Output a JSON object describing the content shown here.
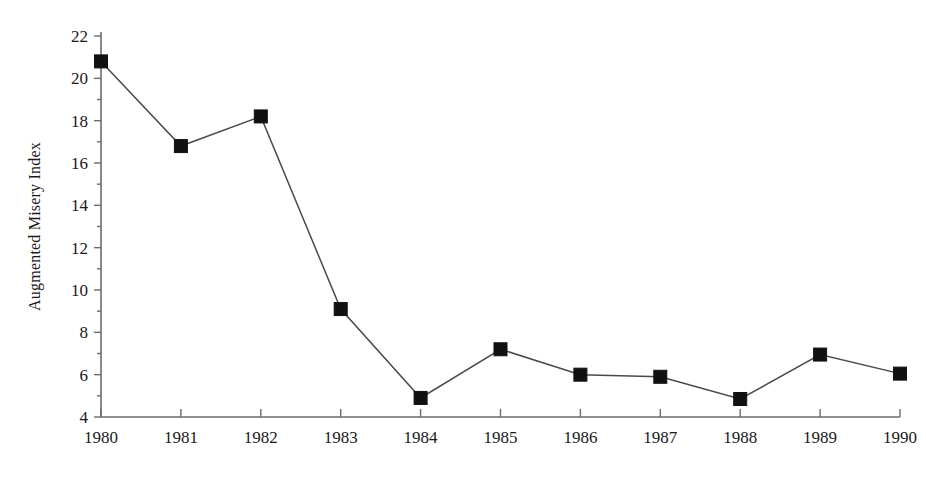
{
  "chart_data": {
    "type": "line",
    "title": "",
    "subtitle": "",
    "xlabel": "",
    "ylabel": "Augmented Misery Index",
    "categories": [
      "1980",
      "1981",
      "1982",
      "1983",
      "1984",
      "1985",
      "1986",
      "1987",
      "1988",
      "1989",
      "1990"
    ],
    "x": [
      1980,
      1981,
      1982,
      1983,
      1984,
      1985,
      1986,
      1987,
      1988,
      1989,
      1990
    ],
    "values": [
      20.8,
      16.8,
      18.2,
      9.1,
      4.9,
      7.2,
      6.0,
      5.9,
      4.85,
      6.95,
      6.05
    ],
    "series": [
      {
        "name": "Augmented Misery Index",
        "values": [
          20.8,
          16.8,
          18.2,
          9.1,
          4.9,
          7.2,
          6.0,
          5.9,
          4.85,
          6.95,
          6.05
        ],
        "marker": "filled-square",
        "color": "#111111"
      }
    ],
    "ylim": [
      4,
      22
    ],
    "xlim": [
      1980,
      1990
    ],
    "y_ticks": [
      4,
      6,
      8,
      10,
      12,
      14,
      16,
      18,
      20,
      22
    ],
    "y_tick_labels": [
      "4",
      "6",
      "8",
      "10",
      "12",
      "14",
      "16",
      "18",
      "20",
      "22"
    ],
    "y_minor_ticks": [
      5,
      7,
      9,
      11,
      13,
      15,
      17,
      19,
      21
    ],
    "x_ticks": [
      1980,
      1981,
      1982,
      1983,
      1984,
      1985,
      1986,
      1987,
      1988,
      1989,
      1990
    ],
    "x_tick_labels": [
      "1980",
      "1981",
      "1982",
      "1983",
      "1984",
      "1985",
      "1986",
      "1987",
      "1988",
      "1989",
      "1990"
    ],
    "grid": false,
    "legend": false,
    "legend_position": "none",
    "annotations": [],
    "axis_color": "#6b6b6b",
    "line_color": "#4a4a4a",
    "marker_color": "#111111",
    "background_color": "#ffffff"
  }
}
